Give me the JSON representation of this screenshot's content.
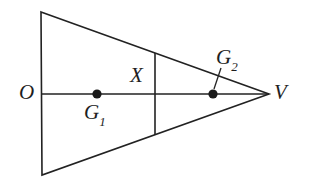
{
  "figure": {
    "background_color": "#ffffff",
    "stroke_color": "#222222",
    "point_color": "#1a1a1a",
    "labels": {
      "origin": "O",
      "chord_point": "X",
      "vertex": "V",
      "g1_base": "G",
      "g1_sub": "1",
      "g2_base": "G",
      "g2_sub": "2"
    }
  }
}
